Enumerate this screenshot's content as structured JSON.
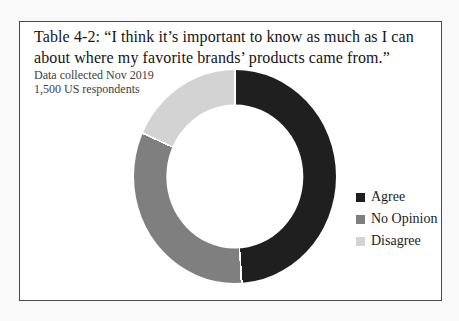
{
  "header": {
    "title_lines": [
      "Table 4-2: “I think it’s important to know as much as I can",
      "about where my favorite brands’ products came from.”"
    ],
    "subtitle_lines": [
      "Data collected Nov 2019",
      "1,500 US respondents"
    ]
  },
  "chart_data": {
    "type": "pie",
    "subtype": "donut",
    "title": "Table 4-2: “I think it’s important to know as much as I can about where my favorite brands’ products came from.”",
    "note": "Data collected Nov 2019, 1,500 US respondents",
    "categories": [
      "Agree",
      "No Opinion",
      "Disagree"
    ],
    "values": [
      49,
      33,
      18
    ],
    "colors": [
      "#1f1f1f",
      "#7f7f7f",
      "#d3d3d3"
    ],
    "hole_ratio": 0.68,
    "start_angle_deg": 0,
    "direction": "clockwise",
    "separator_color": "#ffffff",
    "legend_position": "right"
  },
  "frame": {
    "background": "#ffffff",
    "border_color": "#4a4a4a",
    "page_background": "#f9f9f9"
  }
}
